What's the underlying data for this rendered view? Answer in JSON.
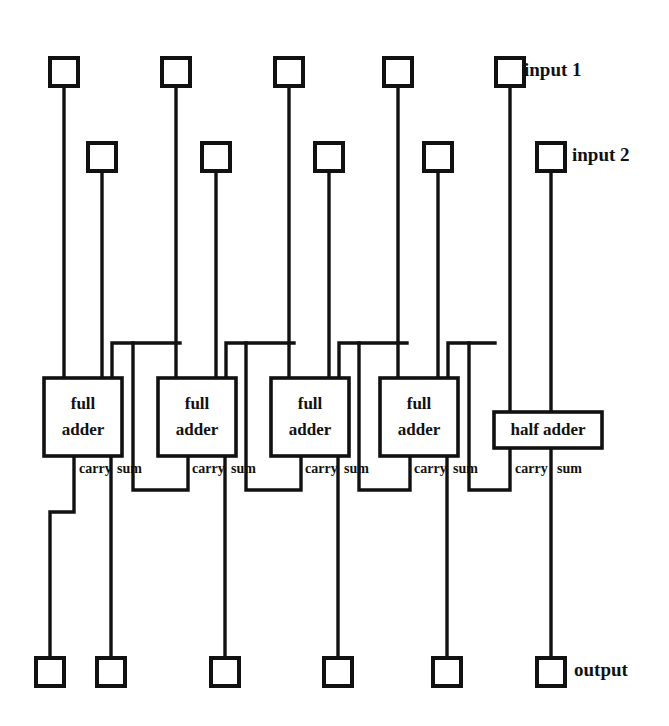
{
  "diagram": {
    "background_color": "#ffffff",
    "line_color": "#111111",
    "labels": {
      "full_adder_line1": "full",
      "full_adder_line2": "adder",
      "half_adder": "half adder",
      "carry": "carry",
      "sum": "sum",
      "input_1": "input 1",
      "input_2": "input 2",
      "output": "output"
    },
    "adders": [
      {
        "id": "full-adder-1",
        "type": "full",
        "line1": "full",
        "line2": "adder",
        "carry_label": "carry",
        "sum_label": "sum"
      },
      {
        "id": "full-adder-2",
        "type": "full",
        "line1": "full",
        "line2": "adder",
        "carry_label": "carry",
        "sum_label": "sum"
      },
      {
        "id": "full-adder-3",
        "type": "full",
        "line1": "full",
        "line2": "adder",
        "carry_label": "carry",
        "sum_label": "sum"
      },
      {
        "id": "full-adder-4",
        "type": "full",
        "line1": "full",
        "line2": "adder",
        "carry_label": "carry",
        "sum_label": "sum"
      },
      {
        "id": "half-adder-1",
        "type": "half",
        "line1": "half adder",
        "carry_label": "carry",
        "sum_label": "sum"
      }
    ],
    "annotations": [
      {
        "id": "input-1",
        "text": "input 1"
      },
      {
        "id": "input-2",
        "text": "input 2"
      },
      {
        "id": "output",
        "text": "output"
      }
    ],
    "counts": {
      "full_adders": 4,
      "half_adders": 1,
      "top_input_terminals": 10,
      "bottom_output_terminals": 6
    }
  }
}
